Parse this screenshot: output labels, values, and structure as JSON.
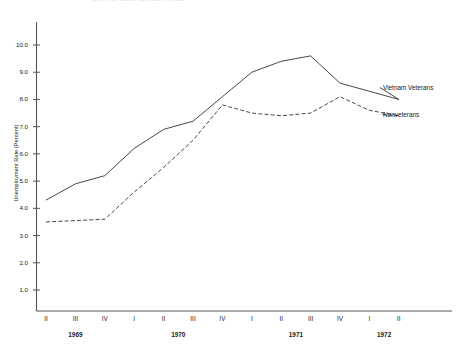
{
  "figure": {
    "cut_title_fragment": "CHART 3. UNEMPLOYMENT RATES",
    "y_axis_title": "Unemployment Rate (Percent)"
  },
  "axes": {
    "y_tick_labels": [
      "10.0",
      "9.0",
      "8.0",
      "7.0",
      "6.0",
      "5.0",
      "4.0",
      "3.0",
      "2.0",
      "1.0"
    ],
    "x_quarter_labels": [
      "II",
      "III",
      "IV",
      "I",
      "II",
      "III",
      "IV",
      "I",
      "II",
      "III",
      "IV",
      "I",
      "II"
    ],
    "x_year_labels": [
      "1969",
      "1970",
      "1971",
      "1972"
    ]
  },
  "legend": {
    "entries": [
      {
        "label": "Vietnam Veterans",
        "style": "solid"
      },
      {
        "label": "Nonveterans",
        "style": "dashed"
      }
    ]
  },
  "colors": {
    "line": "#333333",
    "axis": "#555555",
    "background": "#ffffff"
  },
  "chart_data": {
    "type": "line",
    "title": "CHART 3. UNEMPLOYMENT RATES",
    "xlabel": "",
    "ylabel": "Unemployment Rate (Percent)",
    "ylim": [
      0,
      11
    ],
    "ytick_values": [
      10.0,
      9.0,
      8.0,
      7.0,
      6.0,
      5.0,
      4.0,
      3.0,
      2.0,
      1.0
    ],
    "grid": false,
    "legend_position": "right",
    "categories": [
      "II 1969",
      "III 1969",
      "IV 1969",
      "I 1970",
      "II 1970",
      "III 1970",
      "IV 1970",
      "I 1971",
      "II 1971",
      "III 1971",
      "IV 1971",
      "I 1972",
      "II 1972"
    ],
    "series": [
      {
        "name": "Vietnam Veterans",
        "style": "solid",
        "values": [
          4.3,
          4.9,
          5.2,
          6.2,
          6.9,
          7.2,
          8.1,
          9.0,
          9.4,
          9.6,
          8.6,
          8.3,
          8.0
        ]
      },
      {
        "name": "Nonveterans",
        "style": "dashed",
        "values": [
          3.5,
          3.55,
          3.6,
          4.6,
          5.5,
          6.5,
          7.8,
          7.5,
          7.4,
          7.5,
          8.1,
          7.6,
          7.4
        ]
      }
    ]
  }
}
